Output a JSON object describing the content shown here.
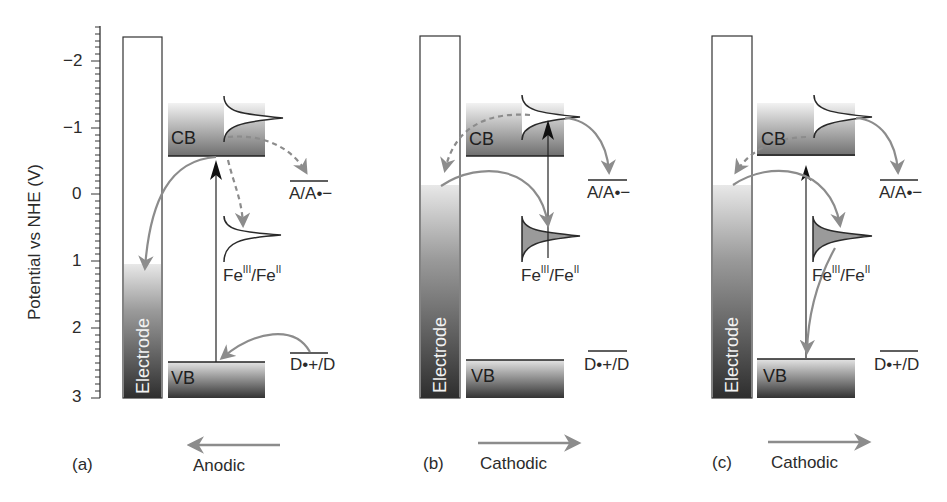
{
  "figure": {
    "y_axis": {
      "label": "Potential vs NHE (V)",
      "ticks": [
        "−2",
        "−1",
        "0",
        "1",
        "2",
        "3"
      ],
      "range": [
        -2.4,
        3
      ],
      "inverted": true
    },
    "panels": [
      {
        "id": "a",
        "label": "(a)",
        "direction": "Anodic",
        "direction_arrow": "left",
        "electrode_label": "Electrode",
        "electrode_fermi_level_V": 1.0,
        "cb_label": "CB",
        "vb_label": "VB",
        "cb_edge_V": -0.6,
        "vb_edge_V": 2.5,
        "acceptor_label": "A/A•−",
        "acceptor_V": -0.2,
        "donor_label": "D•+/D",
        "donor_V": 2.4,
        "fe_label_main": "Fe",
        "fe_sup1": "III",
        "fe_mid": "/Fe",
        "fe_sup2": "II",
        "fe_state": "empty"
      },
      {
        "id": "b",
        "label": "(b)",
        "direction": "Cathodic",
        "direction_arrow": "right",
        "electrode_label": "Electrode",
        "electrode_fermi_level_V": -0.2,
        "cb_label": "CB",
        "vb_label": "VB",
        "acceptor_label": "A/A•−",
        "donor_label": "D•+/D",
        "fe_label_main": "Fe",
        "fe_sup1": "III",
        "fe_mid": "/Fe",
        "fe_sup2": "II",
        "fe_state": "filled"
      },
      {
        "id": "c",
        "label": "(c)",
        "direction": "Cathodic",
        "direction_arrow": "right",
        "electrode_label": "Electrode",
        "electrode_fermi_level_V": -0.2,
        "cb_label": "CB",
        "vb_label": "VB",
        "acceptor_label": "A/A•−",
        "donor_label": "D•+/D",
        "fe_label_main": "Fe",
        "fe_sup1": "III",
        "fe_mid": "/Fe",
        "fe_sup2": "II",
        "fe_state": "filled"
      }
    ],
    "colors": {
      "arrow_gray": "#8c8c8c",
      "line_dark": "#2a2a2a",
      "band_dark": "#3a3a3a",
      "band_light": "#e6e6e6"
    }
  }
}
